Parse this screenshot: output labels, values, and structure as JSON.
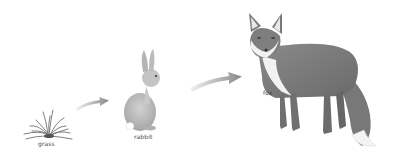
{
  "organisms": [
    {
      "name": "grass",
      "role": "producer"
    },
    {
      "name": "rabbit",
      "role": "primary consumer"
    },
    {
      "name": "fox",
      "role": "secondary consumer"
    }
  ],
  "links": [
    {
      "from": "grass",
      "to": "rabbit"
    },
    {
      "from": "rabbit",
      "to": "fox"
    }
  ],
  "colors": {
    "arrow_start": "#e6e6e6",
    "arrow_end": "#8a8a8a",
    "grass": "#6f6f6f",
    "rabbit_body": "#bdbdbd",
    "fox_body": "#7a7a7a",
    "fox_white": "#f4f4f4"
  }
}
